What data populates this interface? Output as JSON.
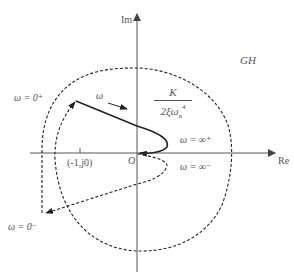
{
  "figure": {
    "title_label": "GH",
    "axes": {
      "imag_label": "Im",
      "real_label": "Re",
      "origin_label": "O",
      "critical_point_label": "(-1,j0)"
    },
    "annotations": {
      "omega_zero_plus": "ω = 0⁺",
      "omega_zero_minus": "ω = 0⁻",
      "omega_inf_plus": "ω = ∞⁺",
      "omega_inf_minus": "ω = ∞⁻",
      "omega_direction": "ω",
      "gain_numerator": "K",
      "gain_denominator_base": "2ξω",
      "gain_denominator_sub": "n",
      "gain_denominator_sup": "4"
    },
    "colors": {
      "axis": "#555555",
      "curve": "#222222",
      "text": "#555555"
    }
  }
}
